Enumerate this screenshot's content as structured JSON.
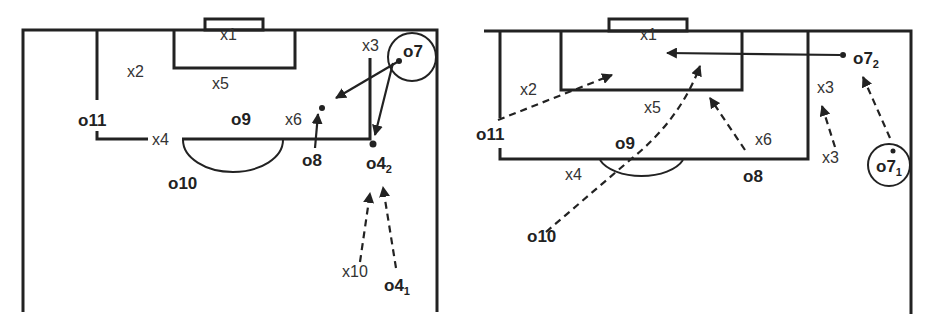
{
  "diagrams": [
    {
      "id": "left",
      "labels": {
        "x1": "x1",
        "x2": "x2",
        "x3": "x3",
        "x4": "x4",
        "x5": "x5",
        "x6": "x6",
        "x10": "x10",
        "o7": "o7",
        "o8": "o8",
        "o9": "o9",
        "o10": "o10",
        "o11": "o11",
        "o4_2": "o4",
        "o4_2_sub": "2",
        "o4_1": "o4",
        "o4_1_sub": "1"
      }
    },
    {
      "id": "right",
      "labels": {
        "x1": "x1",
        "x2": "x2",
        "x3a": "x3",
        "x3b": "x3",
        "x4": "x4",
        "x5": "x5",
        "x6": "x6",
        "o7_2": "o7",
        "o7_2_sub": "2",
        "o7_1": "o7",
        "o7_1_sub": "1",
        "o8": "o8",
        "o9": "o9",
        "o10": "o10",
        "o11": "o11"
      }
    }
  ]
}
